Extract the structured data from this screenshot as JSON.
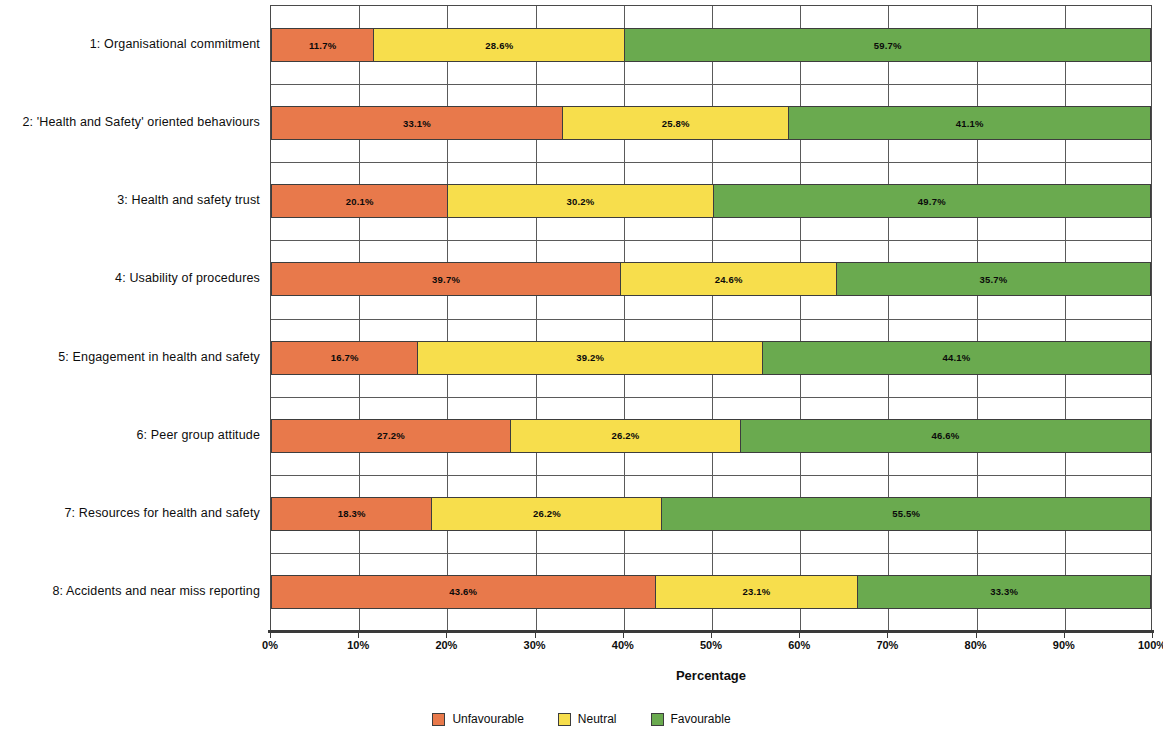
{
  "chart_data": {
    "type": "bar",
    "subtype": "stacked-horizontal-100",
    "title": "",
    "subtitle": "",
    "xlabel": "Percentage",
    "ylabel": "",
    "xlim": [
      0,
      100
    ],
    "xticks": [
      "0%",
      "10%",
      "20%",
      "30%",
      "40%",
      "50%",
      "60%",
      "70%",
      "80%",
      "90%",
      "100%"
    ],
    "xtick_values": [
      0,
      10,
      20,
      30,
      40,
      50,
      60,
      70,
      80,
      90,
      100
    ],
    "grid": "vertical-and-horizontal",
    "legend_position": "bottom-center",
    "categories": [
      "1: Organisational commitment",
      "2: 'Health and Safety' oriented behaviours",
      "3: Health and safety trust",
      "4: Usability of procedures",
      "5: Engagement in health and safety",
      "6: Peer group attitude",
      "7: Resources for health and safety",
      "8: Accidents and near miss reporting"
    ],
    "series": [
      {
        "name": "Unfavourable",
        "color": "#E8794B",
        "values": [
          11.7,
          33.1,
          20.1,
          39.7,
          16.7,
          27.2,
          18.3,
          43.6
        ],
        "labels": [
          "11.7%",
          "33.1%",
          "20.1%",
          "39.7%",
          "16.7%",
          "27.2%",
          "18.3%",
          "43.6%"
        ]
      },
      {
        "name": "Neutral",
        "color": "#F7DE4C",
        "values": [
          28.6,
          25.8,
          30.2,
          24.6,
          39.2,
          26.2,
          26.2,
          23.1
        ],
        "labels": [
          "28.6%",
          "25.8%",
          "30.2%",
          "24.6%",
          "39.2%",
          "26.2%",
          "26.2%",
          "23.1%"
        ]
      },
      {
        "name": "Favourable",
        "color": "#6AAA4F",
        "values": [
          59.7,
          41.1,
          49.7,
          35.7,
          44.1,
          46.6,
          55.5,
          33.3
        ],
        "labels": [
          "59.7%",
          "41.1%",
          "49.7%",
          "35.7%",
          "44.1%",
          "46.6%",
          "55.5%",
          "33.3%"
        ]
      }
    ]
  },
  "legend": {
    "items": [
      {
        "label": "Unfavourable",
        "color": "#E8794B"
      },
      {
        "label": "Neutral",
        "color": "#F7DE4C"
      },
      {
        "label": "Favourable",
        "color": "#6AAA4F"
      }
    ]
  },
  "axis": {
    "x_title": "Percentage"
  }
}
